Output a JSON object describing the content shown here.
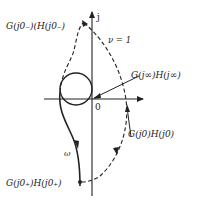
{
  "diagram": {
    "type": "nyquist-plot",
    "axes": {
      "imag_label": "j",
      "origin_label": "0"
    },
    "labels": {
      "g_j0_minus": "G(j0₋)(H(j0₋)",
      "nu": "ν = 1",
      "g_jinf": "G(j∞)H(j∞)",
      "g_j0": "G(j0)H(j0)",
      "omega": "ω",
      "g_j0_plus": "G(j0₊)H(j0₊)"
    },
    "colors": {
      "stroke": "#222222",
      "background": "#ffffff"
    }
  }
}
